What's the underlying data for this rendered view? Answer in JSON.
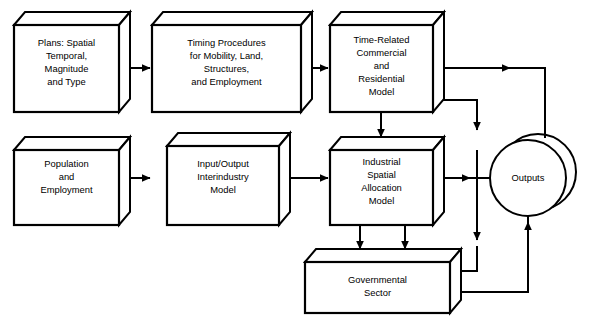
{
  "diagram": {
    "background_color": "#ffffff",
    "line_color": "#000000",
    "nodes": [
      {
        "id": "plans",
        "shape": "cube",
        "lines": [
          "Plans: Spatial",
          "Temporal,",
          "Magnitude",
          "and Type"
        ]
      },
      {
        "id": "timing",
        "shape": "cube",
        "lines": [
          "Timing Procedures",
          "for Mobility, Land,",
          "Structures,",
          "and Employment"
        ]
      },
      {
        "id": "time-related",
        "shape": "cube",
        "lines": [
          "Time-Related",
          "Commercial",
          "and",
          "Residential",
          "Model"
        ]
      },
      {
        "id": "population",
        "shape": "cube",
        "lines": [
          "Population",
          "and",
          "Employment"
        ]
      },
      {
        "id": "input-output",
        "shape": "cube",
        "lines": [
          "Input/Output",
          "Interindustry",
          "Model"
        ]
      },
      {
        "id": "industrial",
        "shape": "cube",
        "lines": [
          "Industrial",
          "Spatial",
          "Allocation",
          "Model"
        ]
      },
      {
        "id": "government",
        "shape": "cube",
        "lines": [
          "Governmental",
          "Sector"
        ]
      },
      {
        "id": "outputs",
        "shape": "cylinder-circle",
        "lines": [
          "Outputs"
        ]
      }
    ],
    "edges": [
      {
        "from": "plans",
        "to": "timing",
        "style": "arrow"
      },
      {
        "from": "timing",
        "to": "time-related",
        "style": "arrow"
      },
      {
        "from": "population",
        "to": "input-output",
        "style": "arrow"
      },
      {
        "from": "input-output",
        "to": "industrial",
        "style": "arrow"
      },
      {
        "from": "time-related",
        "to": "industrial",
        "style": "arrow"
      },
      {
        "from": "time-related",
        "to": "outputs",
        "style": "arrow"
      },
      {
        "from": "time-related",
        "to": "government",
        "style": "arrow"
      },
      {
        "from": "industrial",
        "to": "outputs",
        "style": "arrow"
      },
      {
        "from": "industrial",
        "to": "government",
        "style": "arrow"
      },
      {
        "from": "government",
        "to": "time-related",
        "style": "arrow"
      },
      {
        "from": "government",
        "to": "outputs",
        "style": "arrow"
      }
    ]
  }
}
